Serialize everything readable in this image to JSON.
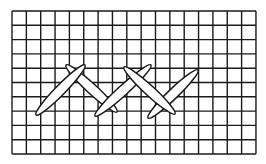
{
  "diagram": {
    "title": "Herringbone stitch on grid",
    "grid": {
      "columns": 17,
      "rows": 10,
      "left": 12,
      "top": 11,
      "cell_width": 14.35,
      "cell_height": 14.3,
      "line_color": "#1a1a1a",
      "line_width": 1.4
    },
    "stitch_style": {
      "fill": "#ffffff",
      "stroke": "#1a1a1a",
      "stroke_width": 1.5,
      "thickness": 10
    },
    "stitches": [
      {
        "id": "stitch-2",
        "direction": "down-right",
        "x1": 66,
        "y1": 65,
        "x2": 117,
        "y2": 112
      },
      {
        "id": "stitch-1",
        "direction": "up-right",
        "x1": 36,
        "y1": 115,
        "x2": 85,
        "y2": 65
      },
      {
        "id": "stitch-3",
        "direction": "up-right",
        "x1": 95,
        "y1": 116,
        "x2": 151,
        "y2": 65
      },
      {
        "id": "stitch-5",
        "direction": "up-right",
        "x1": 148,
        "y1": 118,
        "x2": 198,
        "y2": 70
      },
      {
        "id": "stitch-4",
        "direction": "down-right",
        "x1": 124,
        "y1": 67,
        "x2": 175,
        "y2": 114
      }
    ]
  }
}
